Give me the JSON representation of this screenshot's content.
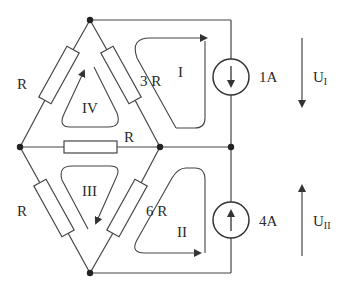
{
  "diagram": {
    "type": "circuit",
    "resistors": {
      "top_left": "R",
      "top_right": "3 R",
      "middle": "R",
      "bottom_left": "R",
      "bottom_right": "6 R"
    },
    "sources": {
      "upper": {
        "value": "1A",
        "direction": "down"
      },
      "lower": {
        "value": "4A",
        "direction": "up"
      }
    },
    "loops": {
      "loop1": "I",
      "loop2": "II",
      "loop3": "III",
      "loop4": "IV"
    },
    "voltages": {
      "upper": {
        "label": "U",
        "subscript": "I",
        "direction": "down"
      },
      "lower": {
        "label": "U",
        "subscript": "II",
        "direction": "up"
      }
    },
    "colors": {
      "line": "#444444",
      "background": "#ffffff"
    }
  }
}
